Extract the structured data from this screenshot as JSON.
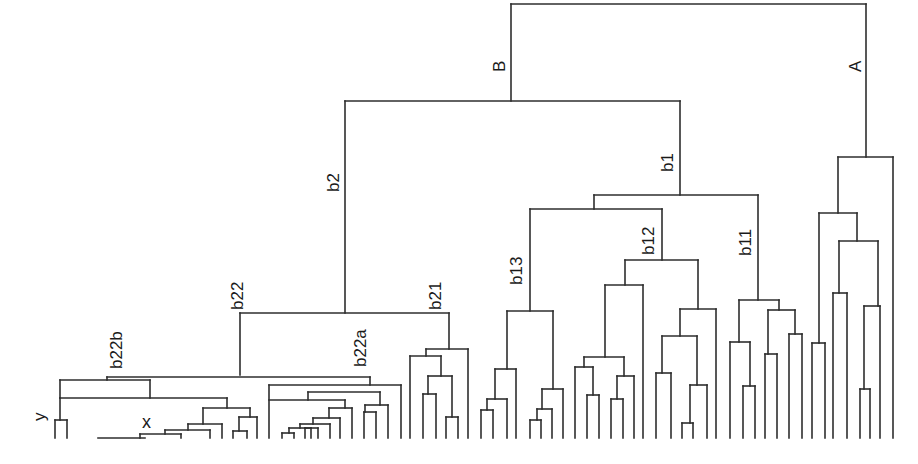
{
  "diagram": {
    "type": "dendrogram",
    "orientation": "top-down",
    "line_color": "#2e2e2e",
    "background": "#ffffff",
    "clade_labels": [
      {
        "id": "A",
        "text": "A",
        "x": 857,
        "y": 78
      },
      {
        "id": "B",
        "text": "B",
        "x": 502,
        "y": 78
      },
      {
        "id": "b1",
        "text": "b1",
        "x": 670,
        "y": 170
      },
      {
        "id": "b2",
        "text": "b2",
        "x": 336,
        "y": 192
      },
      {
        "id": "b11",
        "text": "b11",
        "x": 741,
        "y": 256
      },
      {
        "id": "b12",
        "text": "b12",
        "x": 640,
        "y": 256
      },
      {
        "id": "b13",
        "text": "b13",
        "x": 510,
        "y": 290
      },
      {
        "id": "b21",
        "text": "b21",
        "x": 428,
        "y": 310
      },
      {
        "id": "b22",
        "text": "b22",
        "x": 231,
        "y": 310
      },
      {
        "id": "b22a",
        "text": "b22a",
        "x": 353,
        "y": 368
      },
      {
        "id": "b22b",
        "text": "b22b",
        "x": 108,
        "y": 373
      }
    ],
    "point_labels": [
      {
        "id": "y",
        "text": "y",
        "x": 30,
        "y": 422
      },
      {
        "id": "x",
        "text": "x",
        "x": 142,
        "y": 415
      }
    ],
    "segments": [
      [
        511,
        4,
        866,
        4
      ],
      [
        511,
        4,
        511,
        101
      ],
      [
        866,
        4,
        866,
        157
      ],
      [
        345,
        101,
        680,
        101
      ],
      [
        345,
        101,
        345,
        313
      ],
      [
        680,
        101,
        680,
        195
      ],
      [
        838,
        157,
        893,
        157
      ],
      [
        893,
        157,
        893,
        438
      ],
      [
        838,
        157,
        838,
        213
      ],
      [
        819,
        213,
        857,
        213
      ],
      [
        819,
        213,
        819,
        343
      ],
      [
        857,
        213,
        857,
        241
      ],
      [
        839,
        241,
        878,
        241
      ],
      [
        839,
        241,
        839,
        293
      ],
      [
        878,
        241,
        878,
        306
      ],
      [
        833,
        293,
        847,
        293
      ],
      [
        833,
        293,
        833,
        438
      ],
      [
        847,
        293,
        847,
        438
      ],
      [
        864,
        306,
        880,
        306
      ],
      [
        864,
        306,
        864,
        389
      ],
      [
        880,
        306,
        880,
        438
      ],
      [
        860,
        389,
        870,
        389
      ],
      [
        860,
        389,
        860,
        438
      ],
      [
        870,
        389,
        870,
        438
      ],
      [
        812,
        343,
        825,
        343
      ],
      [
        812,
        343,
        812,
        438
      ],
      [
        825,
        343,
        825,
        438
      ],
      [
        594,
        195,
        758,
        195
      ],
      [
        594,
        195,
        594,
        209
      ],
      [
        758,
        195,
        758,
        300
      ],
      [
        530,
        209,
        662,
        209
      ],
      [
        530,
        209,
        530,
        311
      ],
      [
        662,
        209,
        662,
        260
      ],
      [
        739,
        300,
        779,
        300
      ],
      [
        739,
        300,
        739,
        342
      ],
      [
        779,
        300,
        779,
        310
      ],
      [
        730,
        342,
        750,
        342
      ],
      [
        730,
        342,
        730,
        438
      ],
      [
        750,
        342,
        750,
        386
      ],
      [
        743,
        386,
        755,
        386
      ],
      [
        743,
        386,
        743,
        438
      ],
      [
        755,
        386,
        755,
        438
      ],
      [
        768,
        310,
        795,
        310
      ],
      [
        768,
        310,
        768,
        354
      ],
      [
        795,
        310,
        795,
        334
      ],
      [
        765,
        354,
        777,
        354
      ],
      [
        765,
        354,
        765,
        438
      ],
      [
        777,
        354,
        777,
        438
      ],
      [
        789,
        334,
        802,
        334
      ],
      [
        789,
        334,
        789,
        438
      ],
      [
        802,
        334,
        802,
        438
      ],
      [
        625,
        260,
        698,
        260
      ],
      [
        625,
        260,
        625,
        285
      ],
      [
        698,
        260,
        698,
        309
      ],
      [
        605,
        285,
        643,
        285
      ],
      [
        605,
        285,
        605,
        357
      ],
      [
        643,
        285,
        643,
        438
      ],
      [
        584,
        357,
        624,
        357
      ],
      [
        584,
        357,
        584,
        367
      ],
      [
        624,
        357,
        624,
        376
      ],
      [
        575,
        367,
        593,
        367
      ],
      [
        575,
        367,
        575,
        438
      ],
      [
        593,
        367,
        593,
        395
      ],
      [
        587,
        395,
        599,
        395
      ],
      [
        587,
        395,
        587,
        438
      ],
      [
        599,
        395,
        599,
        438
      ],
      [
        617,
        376,
        634,
        376
      ],
      [
        617,
        376,
        617,
        399
      ],
      [
        634,
        376,
        634,
        438
      ],
      [
        611,
        399,
        623,
        399
      ],
      [
        611,
        399,
        611,
        438
      ],
      [
        623,
        399,
        623,
        438
      ],
      [
        680,
        309,
        716,
        309
      ],
      [
        680,
        309,
        680,
        336
      ],
      [
        716,
        309,
        716,
        438
      ],
      [
        662,
        336,
        697,
        336
      ],
      [
        662,
        336,
        662,
        373
      ],
      [
        697,
        336,
        697,
        385
      ],
      [
        656,
        373,
        671,
        373
      ],
      [
        656,
        373,
        656,
        438
      ],
      [
        671,
        373,
        671,
        438
      ],
      [
        690,
        385,
        707,
        385
      ],
      [
        690,
        385,
        690,
        423
      ],
      [
        707,
        385,
        707,
        438
      ],
      [
        682,
        423,
        693,
        423
      ],
      [
        682,
        423,
        682,
        438
      ],
      [
        693,
        423,
        693,
        438
      ],
      [
        507,
        311,
        553,
        311
      ],
      [
        507,
        311,
        507,
        369
      ],
      [
        553,
        311,
        553,
        389
      ],
      [
        495,
        369,
        516,
        369
      ],
      [
        495,
        369,
        495,
        399
      ],
      [
        516,
        369,
        516,
        438
      ],
      [
        487,
        399,
        507,
        399
      ],
      [
        487,
        399,
        487,
        410
      ],
      [
        507,
        399,
        507,
        438
      ],
      [
        481,
        410,
        493,
        410
      ],
      [
        481,
        410,
        481,
        438
      ],
      [
        493,
        410,
        493,
        438
      ],
      [
        542,
        389,
        563,
        389
      ],
      [
        542,
        389,
        542,
        409
      ],
      [
        563,
        389,
        563,
        438
      ],
      [
        537,
        409,
        552,
        409
      ],
      [
        537,
        409,
        537,
        420
      ],
      [
        552,
        409,
        552,
        438
      ],
      [
        530,
        420,
        541,
        420
      ],
      [
        530,
        420,
        530,
        438
      ],
      [
        541,
        420,
        541,
        438
      ],
      [
        240,
        313,
        449,
        313
      ],
      [
        240,
        313,
        240,
        375
      ],
      [
        449,
        313,
        449,
        349
      ],
      [
        426,
        349,
        468,
        349
      ],
      [
        426,
        349,
        426,
        356
      ],
      [
        468,
        349,
        468,
        438
      ],
      [
        410,
        356,
        441,
        356
      ],
      [
        410,
        356,
        410,
        438
      ],
      [
        441,
        356,
        441,
        376
      ],
      [
        428,
        376,
        452,
        376
      ],
      [
        428,
        376,
        428,
        394
      ],
      [
        452,
        376,
        452,
        417
      ],
      [
        423,
        394,
        436,
        394
      ],
      [
        423,
        394,
        423,
        438
      ],
      [
        436,
        394,
        436,
        438
      ],
      [
        446,
        417,
        458,
        417
      ],
      [
        446,
        417,
        446,
        438
      ],
      [
        458,
        417,
        458,
        438
      ],
      [
        107,
        377,
        370,
        377
      ],
      [
        107,
        377,
        107,
        380
      ],
      [
        370,
        377,
        370,
        385
      ],
      [
        60,
        380,
        150,
        380
      ],
      [
        60,
        380,
        60,
        398
      ],
      [
        150,
        380,
        150,
        398
      ],
      [
        60,
        398,
        227,
        398
      ],
      [
        60,
        398,
        60,
        420
      ],
      [
        227,
        398,
        227,
        408
      ],
      [
        55,
        420,
        67,
        420
      ],
      [
        55,
        420,
        55,
        438
      ],
      [
        67,
        420,
        67,
        438
      ],
      [
        203,
        408,
        250,
        408
      ],
      [
        203,
        408,
        203,
        424
      ],
      [
        250,
        408,
        250,
        417
      ],
      [
        188,
        424,
        222,
        424
      ],
      [
        188,
        424,
        188,
        430
      ],
      [
        222,
        424,
        222,
        438
      ],
      [
        165,
        430,
        210,
        430
      ],
      [
        165,
        430,
        165,
        434
      ],
      [
        210,
        430,
        210,
        438
      ],
      [
        140,
        434,
        181,
        434
      ],
      [
        140,
        434,
        140,
        438
      ],
      [
        181,
        434,
        181,
        438
      ],
      [
        98,
        438,
        145,
        438
      ],
      [
        239,
        417,
        257,
        417
      ],
      [
        239,
        417,
        239,
        431
      ],
      [
        257,
        417,
        257,
        438
      ],
      [
        233,
        431,
        247,
        431
      ],
      [
        233,
        431,
        233,
        438
      ],
      [
        247,
        431,
        247,
        438
      ],
      [
        269,
        385,
        401,
        385
      ],
      [
        269,
        385,
        269,
        438
      ],
      [
        401,
        385,
        401,
        438
      ],
      [
        308,
        392,
        380,
        392
      ],
      [
        308,
        392,
        308,
        400
      ],
      [
        380,
        392,
        380,
        405
      ],
      [
        269,
        400,
        345,
        400
      ],
      [
        345,
        400,
        345,
        408
      ],
      [
        329,
        408,
        352,
        408
      ],
      [
        329,
        408,
        329,
        418
      ],
      [
        352,
        408,
        352,
        438
      ],
      [
        313,
        418,
        340,
        418
      ],
      [
        313,
        418,
        313,
        424
      ],
      [
        340,
        418,
        340,
        438
      ],
      [
        300,
        424,
        330,
        424
      ],
      [
        300,
        424,
        300,
        428
      ],
      [
        330,
        424,
        330,
        438
      ],
      [
        289,
        428,
        318,
        428
      ],
      [
        289,
        428,
        289,
        433
      ],
      [
        318,
        428,
        318,
        438
      ],
      [
        282,
        433,
        294,
        433
      ],
      [
        282,
        433,
        282,
        438
      ],
      [
        294,
        433,
        294,
        438
      ],
      [
        305,
        428,
        311,
        428
      ],
      [
        305,
        428,
        305,
        438
      ],
      [
        311,
        428,
        311,
        438
      ],
      [
        365,
        405,
        388,
        405
      ],
      [
        365,
        405,
        365,
        412
      ],
      [
        388,
        405,
        388,
        438
      ],
      [
        364,
        412,
        376,
        412
      ],
      [
        364,
        412,
        364,
        438
      ],
      [
        376,
        412,
        376,
        438
      ]
    ]
  }
}
